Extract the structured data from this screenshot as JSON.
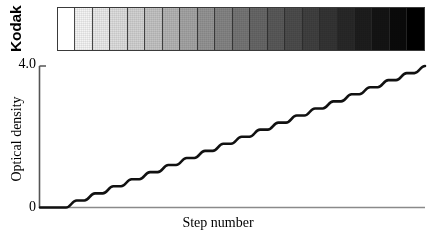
{
  "figure": {
    "background_color": "#ffffff",
    "axis_color": "#808080",
    "curve_color": "#111111"
  },
  "wedge": {
    "brand_label": "Kodak",
    "border_color": "#3a3a3a",
    "step_count": 21,
    "step_grays": [
      "#ffffff",
      "#f4f4f4",
      "#eaeaea",
      "#dedede",
      "#d2d2d2",
      "#c3c3c3",
      "#b4b4b4",
      "#a4a4a4",
      "#949494",
      "#848484",
      "#757575",
      "#676767",
      "#595959",
      "#4c4c4c",
      "#404040",
      "#343434",
      "#282828",
      "#1d1d1d",
      "#141414",
      "#0a0a0a",
      "#000000"
    ]
  },
  "chart_data": {
    "type": "line",
    "title": "",
    "subtitle": "",
    "xlabel": "Step number",
    "ylabel": "Optical density",
    "grid": false,
    "legend": null,
    "xlim": [
      0,
      21
    ],
    "ylim": [
      0,
      4.0
    ],
    "ytick_labels": [
      "4.0",
      "0"
    ],
    "ytick_values": [
      4.0,
      0
    ],
    "xtick_labels": [],
    "annotations": [],
    "series": [
      {
        "name": "Optical density vs step number",
        "style": "staircase",
        "x": [
          0,
          1,
          2,
          3,
          4,
          5,
          6,
          7,
          8,
          9,
          10,
          11,
          12,
          13,
          14,
          15,
          16,
          17,
          18,
          19,
          20,
          21
        ],
        "values": [
          0.0,
          0.0,
          0.2,
          0.4,
          0.6,
          0.8,
          1.0,
          1.2,
          1.4,
          1.6,
          1.8,
          2.0,
          2.2,
          2.4,
          2.6,
          2.8,
          3.0,
          3.2,
          3.4,
          3.6,
          3.8,
          4.0
        ]
      }
    ]
  },
  "axis": {
    "y_max_label": "4.0",
    "y_min_label": "0",
    "y_title": "Optical density",
    "x_title": "Step number"
  }
}
